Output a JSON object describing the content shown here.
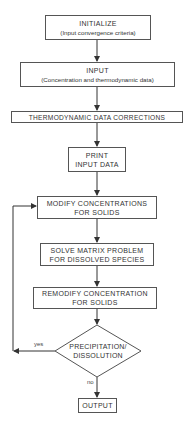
{
  "flowchart": {
    "initialize": {
      "title": "INITIALIZE",
      "subtitle": "(Input convergence criteria)"
    },
    "input": {
      "title": "INPUT",
      "subtitle": "(Concentration and thermodynamic data)"
    },
    "thermo": {
      "title": "THERMODYNAMIC DATA CORRECTIONS"
    },
    "print": {
      "line1": "PRINT",
      "line2": "INPUT DATA"
    },
    "modify": {
      "line1": "MODIFY CONCENTRATIONS",
      "line2": "FOR SOLIDS"
    },
    "solve": {
      "line1": "SOLVE MATRIX PROBLEM",
      "line2": "FOR DISSOLVED SPECIES"
    },
    "remodify": {
      "line1": "REMODIFY CONCENTRATION",
      "line2": "FOR SOLIDS"
    },
    "decision": {
      "line1": "PRECIPITATION/",
      "line2": "DISSOLUTION",
      "yes_label": "yes",
      "no_label": "no"
    },
    "output": {
      "title": "OUTPUT"
    }
  }
}
